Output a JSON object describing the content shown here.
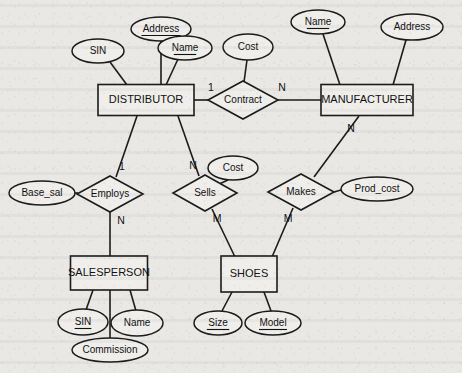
{
  "diagram": {
    "notation": "Chen",
    "background_color": "#e9e8e5",
    "ink_color": "#1b1b1b"
  },
  "entities": [
    {
      "id": "distributor",
      "label": "DISTRIBUTOR",
      "x": 146,
      "y": 100,
      "w": 96,
      "h": 31
    },
    {
      "id": "manufacturer",
      "label": "MANUFACTURER",
      "x": 367,
      "y": 100,
      "w": 92,
      "h": 31
    },
    {
      "id": "salesperson",
      "label": "SALESPERSON",
      "x": 109,
      "y": 273,
      "w": 77,
      "h": 34
    },
    {
      "id": "shoes",
      "label": "SHOES",
      "x": 249,
      "y": 274,
      "w": 56,
      "h": 36
    }
  ],
  "relationships": [
    {
      "id": "contract",
      "label": "Contract",
      "x": 243,
      "y": 100,
      "rx": 35,
      "ry": 19
    },
    {
      "id": "employs",
      "label": "Employs",
      "x": 110,
      "y": 194,
      "rx": 33,
      "ry": 18
    },
    {
      "id": "sells",
      "label": "Sells",
      "x": 205,
      "y": 193,
      "rx": 32,
      "ry": 18
    },
    {
      "id": "makes",
      "label": "Makes",
      "x": 301,
      "y": 192,
      "rx": 33,
      "ry": 18
    }
  ],
  "attributes": [
    {
      "id": "dist-sin",
      "label": "SIN",
      "owner": "distributor",
      "key": false,
      "x": 98,
      "y": 51,
      "rx": 26,
      "ry": 12
    },
    {
      "id": "dist-address",
      "label": "Address",
      "owner": "distributor",
      "key": true,
      "x": 161,
      "y": 29,
      "rx": 30,
      "ry": 12
    },
    {
      "id": "dist-name",
      "label": "Name",
      "owner": "distributor",
      "key": true,
      "x": 185,
      "y": 48,
      "rx": 27,
      "ry": 12
    },
    {
      "id": "contract-cost",
      "label": "Cost",
      "owner": "contract",
      "key": false,
      "x": 248,
      "y": 47,
      "rx": 25,
      "ry": 13
    },
    {
      "id": "manu-name",
      "label": "Name",
      "owner": "manufacturer",
      "key": true,
      "x": 318,
      "y": 22,
      "rx": 27,
      "ry": 12
    },
    {
      "id": "manu-address",
      "label": "Address",
      "owner": "manufacturer",
      "key": false,
      "x": 412,
      "y": 27,
      "rx": 31,
      "ry": 13
    },
    {
      "id": "employs-basesal",
      "label": "Base_sal",
      "owner": "employs",
      "key": false,
      "x": 42,
      "y": 193,
      "rx": 33,
      "ry": 12
    },
    {
      "id": "sells-cost",
      "label": "Cost",
      "owner": "sells",
      "key": false,
      "x": 233,
      "y": 168,
      "rx": 25,
      "ry": 12
    },
    {
      "id": "makes-prodcost",
      "label": "Prod_cost",
      "owner": "makes",
      "key": false,
      "x": 377,
      "y": 189,
      "rx": 36,
      "ry": 12
    },
    {
      "id": "sales-sin",
      "label": "SIN",
      "owner": "salesperson",
      "key": true,
      "x": 83,
      "y": 322,
      "rx": 25,
      "ry": 13
    },
    {
      "id": "sales-name",
      "label": "Name",
      "owner": "salesperson",
      "key": false,
      "x": 137,
      "y": 323,
      "rx": 26,
      "ry": 13
    },
    {
      "id": "sales-commission",
      "label": "Commission",
      "owner": "salesperson",
      "key": false,
      "x": 110,
      "y": 350,
      "rx": 38,
      "ry": 12
    },
    {
      "id": "shoes-size",
      "label": "Size",
      "owner": "shoes",
      "key": true,
      "x": 218,
      "y": 323,
      "rx": 24,
      "ry": 12
    },
    {
      "id": "shoes-model",
      "label": "Model",
      "owner": "shoes",
      "key": true,
      "x": 273,
      "y": 323,
      "rx": 28,
      "ry": 12
    }
  ],
  "cardinalities": [
    {
      "id": "card-contract-dist",
      "value": "1",
      "x": 211,
      "y": 88
    },
    {
      "id": "card-contract-manu",
      "value": "N",
      "x": 282,
      "y": 88
    },
    {
      "id": "card-manu-makes",
      "value": "N",
      "x": 351,
      "y": 129
    },
    {
      "id": "card-dist-employs",
      "value": "1",
      "x": 122,
      "y": 167
    },
    {
      "id": "card-employs-sales",
      "value": "N",
      "x": 121,
      "y": 221
    },
    {
      "id": "card-dist-sells",
      "value": "N",
      "x": 193,
      "y": 166
    },
    {
      "id": "card-sells-shoes",
      "value": "M",
      "x": 217,
      "y": 219
    },
    {
      "id": "card-makes-shoes",
      "value": "M",
      "x": 288,
      "y": 219
    }
  ],
  "edges": [
    {
      "id": "edge-dist-sin",
      "from": "dist-sin",
      "to": "distributor",
      "x1": 110,
      "y1": 62,
      "x2": 127,
      "y2": 85
    },
    {
      "id": "edge-dist-address",
      "from": "dist-address",
      "to": "distributor",
      "x1": 161,
      "y1": 41,
      "x2": 161,
      "y2": 85
    },
    {
      "id": "edge-dist-name",
      "from": "dist-name",
      "to": "distributor",
      "x1": 178,
      "y1": 59,
      "x2": 166,
      "y2": 85
    },
    {
      "id": "edge-contract-cost",
      "from": "contract-cost",
      "to": "contract",
      "x1": 247,
      "y1": 60,
      "x2": 244,
      "y2": 82
    },
    {
      "id": "edge-dist-contract",
      "from": "distributor",
      "to": "contract",
      "x1": 194,
      "y1": 100,
      "x2": 209,
      "y2": 100
    },
    {
      "id": "edge-contract-manu",
      "from": "contract",
      "to": "manufacturer",
      "x1": 278,
      "y1": 100,
      "x2": 321,
      "y2": 100
    },
    {
      "id": "edge-manu-name",
      "from": "manu-name",
      "to": "manufacturer",
      "x1": 323,
      "y1": 34,
      "x2": 340,
      "y2": 85
    },
    {
      "id": "edge-manu-address",
      "from": "manu-address",
      "to": "manufacturer",
      "x1": 406,
      "y1": 40,
      "x2": 393,
      "y2": 85
    },
    {
      "id": "edge-manu-makes",
      "from": "manufacturer",
      "to": "makes",
      "x1": 359,
      "y1": 116,
      "x2": 314,
      "y2": 177
    },
    {
      "id": "edge-makes-prodcost",
      "from": "makes",
      "to": "makes-prodcost",
      "x1": 334,
      "y1": 192,
      "x2": 341,
      "y2": 190
    },
    {
      "id": "edge-makes-shoes",
      "from": "makes",
      "to": "shoes",
      "x1": 293,
      "y1": 208,
      "x2": 272,
      "y2": 257
    },
    {
      "id": "edge-dist-employs",
      "from": "distributor",
      "to": "employs",
      "x1": 137,
      "y1": 116,
      "x2": 116,
      "y2": 177
    },
    {
      "id": "edge-employs-basesal",
      "from": "employs-basesal",
      "to": "employs",
      "x1": 75,
      "y1": 193,
      "x2": 78,
      "y2": 193
    },
    {
      "id": "edge-employs-sales",
      "from": "employs",
      "to": "salesperson",
      "x1": 110,
      "y1": 212,
      "x2": 110,
      "y2": 257
    },
    {
      "id": "edge-dist-sells",
      "from": "distributor",
      "to": "sells",
      "x1": 178,
      "y1": 116,
      "x2": 199,
      "y2": 176
    },
    {
      "id": "edge-sells-cost",
      "from": "sells-cost",
      "to": "sells",
      "x1": 228,
      "y1": 180,
      "x2": 217,
      "y2": 185
    },
    {
      "id": "edge-sells-shoes",
      "from": "sells",
      "to": "shoes",
      "x1": 212,
      "y1": 209,
      "x2": 235,
      "y2": 257
    },
    {
      "id": "edge-sales-sin",
      "from": "salesperson",
      "to": "sales-sin",
      "x1": 93,
      "y1": 290,
      "x2": 86,
      "y2": 310
    },
    {
      "id": "edge-sales-name",
      "from": "salesperson",
      "to": "sales-name",
      "x1": 130,
      "y1": 290,
      "x2": 136,
      "y2": 311
    },
    {
      "id": "edge-sales-commission",
      "from": "salesperson",
      "to": "sales-commission",
      "x1": 110,
      "y1": 290,
      "x2": 110,
      "y2": 338
    },
    {
      "id": "edge-shoes-size",
      "from": "shoes",
      "to": "shoes-size",
      "x1": 232,
      "y1": 292,
      "x2": 222,
      "y2": 311
    },
    {
      "id": "edge-shoes-model",
      "from": "shoes",
      "to": "shoes-model",
      "x1": 264,
      "y1": 292,
      "x2": 271,
      "y2": 311
    }
  ]
}
